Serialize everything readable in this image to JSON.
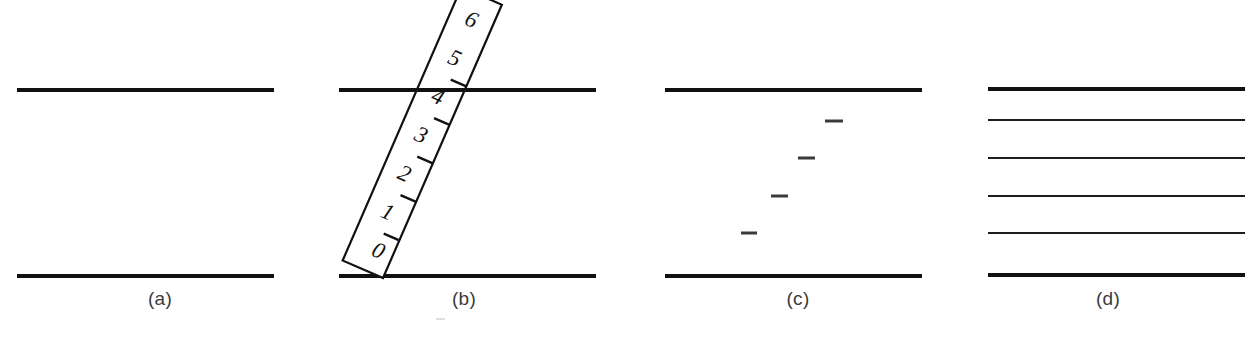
{
  "figure": {
    "background_color": "#ffffff",
    "ink_color": "#111111",
    "caption_color": "#3b3b3b",
    "width": 1259,
    "height": 341
  },
  "panels": [
    {
      "id": "a",
      "caption": "(a)",
      "description": "Two bold horizontal parallel lines",
      "lines": [
        {
          "name": "top-line",
          "x1": 17,
          "y1": 90,
          "x2": 274,
          "y2": 90,
          "thickness": 4
        },
        {
          "name": "bottom-line",
          "x1": 17,
          "y1": 276,
          "x2": 274,
          "y2": 276,
          "thickness": 4
        }
      ]
    },
    {
      "id": "b",
      "caption": "(b)",
      "description": "Tilted ruler with graduations 0 to 6 crossing two bold horizontal lines",
      "lines": [
        {
          "name": "top-line",
          "x1": 339,
          "y1": 90,
          "x2": 596,
          "y2": 90,
          "thickness": 4
        },
        {
          "name": "bottom-line",
          "x1": 339,
          "y1": 276,
          "x2": 596,
          "y2": 276,
          "thickness": 4
        }
      ],
      "ruler": {
        "graduations": [
          "0",
          "1",
          "2",
          "3",
          "4",
          "5",
          "6"
        ],
        "tick_count": 5,
        "angle_degrees": -23,
        "length": 300,
        "width": 44
      }
    },
    {
      "id": "c",
      "caption": "(c)",
      "description": "Two bold horizontal lines with four isolated short tick marks in a diagonal run",
      "lines": [
        {
          "name": "top-line",
          "x1": 665,
          "y1": 90,
          "x2": 922,
          "y2": 90,
          "thickness": 4
        },
        {
          "name": "bottom-line",
          "x1": 665,
          "y1": 276,
          "x2": 922,
          "y2": 276,
          "thickness": 4
        }
      ],
      "ticks": [
        {
          "name": "tick-1",
          "x1": 741,
          "y1": 233,
          "x2": 757,
          "y2": 233
        },
        {
          "name": "tick-2",
          "x1": 771,
          "y1": 196,
          "x2": 788,
          "y2": 196
        },
        {
          "name": "tick-3",
          "x1": 798,
          "y1": 158,
          "x2": 815,
          "y2": 158
        },
        {
          "name": "tick-4",
          "x1": 825,
          "y1": 121,
          "x2": 843,
          "y2": 121
        }
      ]
    },
    {
      "id": "d",
      "caption": "(d)",
      "description": "Six horizontal parallel lines; outermost two are bold, inner four are thin",
      "lines": [
        {
          "name": "line-1",
          "x1": 988,
          "y1": 89,
          "x2": 1245,
          "y2": 89,
          "thickness": 4
        },
        {
          "name": "line-2",
          "x1": 988,
          "y1": 120,
          "x2": 1245,
          "y2": 120,
          "thickness": 2
        },
        {
          "name": "line-3",
          "x1": 988,
          "y1": 158,
          "x2": 1245,
          "y2": 158,
          "thickness": 2
        },
        {
          "name": "line-4",
          "x1": 988,
          "y1": 196,
          "x2": 1245,
          "y2": 196,
          "thickness": 2
        },
        {
          "name": "line-5",
          "x1": 988,
          "y1": 233,
          "x2": 1245,
          "y2": 233,
          "thickness": 2
        },
        {
          "name": "line-6",
          "x1": 988,
          "y1": 275,
          "x2": 1245,
          "y2": 275,
          "thickness": 4
        }
      ]
    }
  ],
  "footer": {
    "note": ""
  }
}
